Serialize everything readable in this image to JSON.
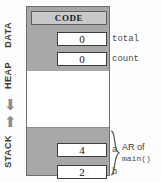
{
  "diagram": {
    "regions": [
      {
        "key": "data",
        "label": "DATA",
        "arrow": ""
      },
      {
        "key": "heap",
        "label": "HEAP",
        "arrow": "⬇"
      },
      {
        "key": "stack",
        "label": "STACK",
        "arrow": "⬆"
      }
    ],
    "code_header": "CODE",
    "slots": [
      {
        "key": "total",
        "value": "0",
        "name": "total"
      },
      {
        "key": "count",
        "value": "0",
        "name": "count"
      },
      {
        "key": "a",
        "value": "4",
        "name": "a"
      },
      {
        "key": "b",
        "value": "2",
        "name": "b"
      }
    ],
    "annotation": {
      "line1": "AR of",
      "line2": "main()"
    },
    "colors": {
      "band": "#a8a8a8",
      "header": "#c9c9c9",
      "box": "#ffffff",
      "outline": "#6f6f6f",
      "arrow": "#8d8d8d"
    }
  }
}
